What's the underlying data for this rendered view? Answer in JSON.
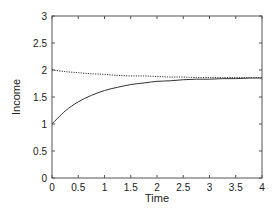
{
  "chart_data": {
    "type": "line",
    "title": "",
    "xlabel": "Time",
    "ylabel": "Income",
    "xlim": [
      0,
      4
    ],
    "ylim": [
      0,
      3
    ],
    "grid": false,
    "legend": null,
    "x_ticks": [
      "0",
      "0.5",
      "1",
      "1.5",
      "2",
      "2.5",
      "3",
      "3.5",
      "4"
    ],
    "y_ticks": [
      "0",
      "0.5",
      "1",
      "1.5",
      "2",
      "2.5",
      "3"
    ],
    "x": [
      0,
      0.25,
      0.5,
      0.75,
      1,
      1.25,
      1.5,
      1.75,
      2,
      2.25,
      2.5,
      2.75,
      3,
      3.25,
      3.5,
      3.75,
      4
    ],
    "series": [
      {
        "name": "solid",
        "style": "solid",
        "color": "#333333",
        "values": [
          1.0,
          1.24,
          1.41,
          1.53,
          1.62,
          1.68,
          1.73,
          1.76,
          1.79,
          1.8,
          1.82,
          1.83,
          1.83,
          1.84,
          1.84,
          1.85,
          1.85
        ]
      },
      {
        "name": "dotted",
        "style": "dotted",
        "color": "#333333",
        "values": [
          2.0,
          1.97,
          1.95,
          1.93,
          1.92,
          1.9,
          1.89,
          1.89,
          1.88,
          1.87,
          1.87,
          1.86,
          1.86,
          1.86,
          1.86,
          1.86,
          1.86
        ]
      }
    ]
  }
}
